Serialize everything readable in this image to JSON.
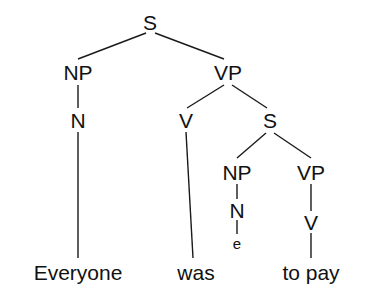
{
  "diagram": {
    "type": "constituency-syntax-tree",
    "sentence": "Everyone was to pay",
    "background_color": "#ffffff",
    "line_color": "#1a1a1a",
    "text_color": "#111111"
  },
  "nodes": {
    "s_root": {
      "label": "S",
      "x": 150,
      "y": 22,
      "kind": "category"
    },
    "np_subject": {
      "label": "NP",
      "x": 78,
      "y": 72,
      "kind": "category"
    },
    "vp_main": {
      "label": "VP",
      "x": 228,
      "y": 72,
      "kind": "category"
    },
    "n_subject": {
      "label": "N",
      "x": 78,
      "y": 120,
      "kind": "category"
    },
    "v_was": {
      "label": "V",
      "x": 186,
      "y": 120,
      "kind": "category"
    },
    "s_embedded": {
      "label": "S",
      "x": 270,
      "y": 120,
      "kind": "category"
    },
    "np_trace": {
      "label": "NP",
      "x": 237,
      "y": 172,
      "kind": "category"
    },
    "vp_embedded": {
      "label": "VP",
      "x": 311,
      "y": 172,
      "kind": "category"
    },
    "n_trace": {
      "label": "N",
      "x": 237,
      "y": 210,
      "kind": "category"
    },
    "v_topay": {
      "label": "V",
      "x": 311,
      "y": 222,
      "kind": "category"
    },
    "trace_e": {
      "label": "e",
      "x": 237,
      "y": 243,
      "kind": "trace"
    },
    "leaf_everyone": {
      "label": "Everyone",
      "x": 78,
      "y": 272,
      "kind": "leaf"
    },
    "leaf_was": {
      "label": "was",
      "x": 196,
      "y": 272,
      "kind": "leaf"
    },
    "leaf_topay": {
      "label": "to pay",
      "x": 311,
      "y": 272,
      "kind": "leaf"
    }
  },
  "edges": [
    {
      "name": "edge-s-to-np",
      "from": "s_root",
      "to": "np_subject",
      "x1": 146,
      "y1": 33,
      "x2": 78,
      "y2": 59
    },
    {
      "name": "edge-s-to-vp",
      "from": "s_root",
      "to": "vp_main",
      "x1": 155,
      "y1": 33,
      "x2": 224,
      "y2": 59
    },
    {
      "name": "edge-np-to-n",
      "from": "np_subject",
      "to": "n_subject",
      "x1": 78,
      "y1": 85,
      "x2": 78,
      "y2": 108
    },
    {
      "name": "edge-n-to-everyone",
      "from": "n_subject",
      "to": "leaf_everyone",
      "x1": 78,
      "y1": 132,
      "x2": 78,
      "y2": 258
    },
    {
      "name": "edge-vp-to-v",
      "from": "vp_main",
      "to": "v_was",
      "x1": 224,
      "y1": 85,
      "x2": 187,
      "y2": 108
    },
    {
      "name": "edge-vp-to-s",
      "from": "vp_main",
      "to": "s_embedded",
      "x1": 232,
      "y1": 85,
      "x2": 267,
      "y2": 108
    },
    {
      "name": "edge-v-to-was",
      "from": "v_was",
      "to": "leaf_was",
      "x1": 186,
      "y1": 132,
      "x2": 193,
      "y2": 258
    },
    {
      "name": "edge-s2-to-np",
      "from": "s_embedded",
      "to": "np_trace",
      "x1": 266,
      "y1": 133,
      "x2": 237,
      "y2": 158
    },
    {
      "name": "edge-s2-to-vp",
      "from": "s_embedded",
      "to": "vp_embedded",
      "x1": 274,
      "y1": 133,
      "x2": 311,
      "y2": 158
    },
    {
      "name": "edge-np2-to-n",
      "from": "np_trace",
      "to": "n_trace",
      "x1": 237,
      "y1": 184,
      "x2": 237,
      "y2": 199
    },
    {
      "name": "edge-n2-to-e",
      "from": "n_trace",
      "to": "trace_e",
      "x1": 237,
      "y1": 220,
      "x2": 237,
      "y2": 234
    },
    {
      "name": "edge-vp2-to-v",
      "from": "vp_embedded",
      "to": "v_topay",
      "x1": 311,
      "y1": 184,
      "x2": 311,
      "y2": 211
    },
    {
      "name": "edge-v2-to-topay",
      "from": "v_topay",
      "to": "leaf_topay",
      "x1": 311,
      "y1": 233,
      "x2": 311,
      "y2": 258
    }
  ]
}
